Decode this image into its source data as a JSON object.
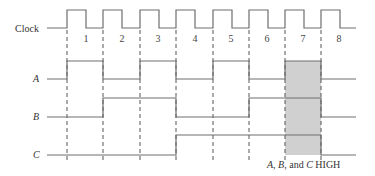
{
  "signals": {
    "clock_label": "Clock",
    "a_label": "A",
    "b_label": "B",
    "c_label": "C"
  },
  "pulse_numbers": [
    "1",
    "2",
    "3",
    "4",
    "5",
    "6",
    "7",
    "8"
  ],
  "intervals": {
    "A": [
      1,
      0,
      1,
      0,
      1,
      0,
      1,
      0
    ],
    "B": [
      0,
      1,
      1,
      0,
      0,
      1,
      1,
      0
    ],
    "C": [
      0,
      0,
      0,
      1,
      1,
      1,
      1,
      0
    ]
  },
  "highlight": {
    "interval": 7,
    "label_parts": [
      "A",
      ", ",
      "B",
      ", and ",
      "C",
      " HIGH"
    ],
    "fill_color": "#d0d0d0"
  },
  "colors": {
    "waveform": "#6e6e6e",
    "dashed_line": "#555555",
    "text": "#333333"
  }
}
